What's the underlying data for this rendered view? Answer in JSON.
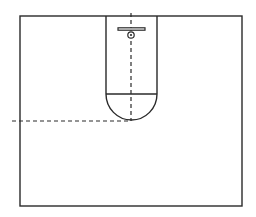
{
  "diagram": {
    "colors": {
      "line": "#2a2a2a",
      "background": "#ffffff"
    },
    "court": {
      "x": 20,
      "y": 16,
      "width": 222,
      "height": 190
    },
    "lane": {
      "left": 106,
      "right": 157,
      "top": 16,
      "free_throw_y": 94
    },
    "free_throw_arc": {
      "cx": 131.5,
      "cy": 94,
      "r": 25.5,
      "bottom_y": 120
    },
    "backboard": {
      "x1": 118,
      "x2": 145,
      "y": 29,
      "thickness": 2.4
    },
    "hoop": {
      "cx": 131,
      "cy": 35,
      "r": 3.2
    },
    "vertical_dashed": {
      "x": 131,
      "y1": 13,
      "y2": 121
    },
    "horizontal_dashed": {
      "y": 121,
      "x1": 12,
      "x2": 131
    }
  }
}
